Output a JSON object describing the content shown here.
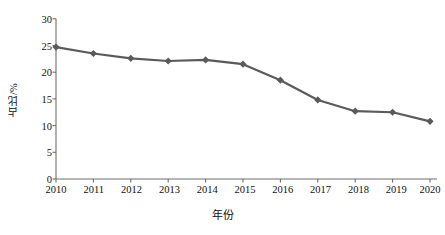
{
  "chart_data": {
    "type": "line",
    "title": "",
    "xlabel": "年份",
    "ylabel": "占比/%",
    "categories": [
      "2010",
      "2011",
      "2012",
      "2013",
      "2014",
      "2015",
      "2016",
      "2017",
      "2018",
      "2019",
      "2020"
    ],
    "values": [
      24.7,
      23.5,
      22.6,
      22.1,
      22.3,
      21.5,
      18.5,
      14.8,
      12.7,
      12.5,
      10.8
    ],
    "series": [
      {
        "name": "占比",
        "values": [
          24.7,
          23.5,
          22.6,
          22.1,
          22.3,
          21.5,
          18.5,
          14.8,
          12.7,
          12.5,
          10.8
        ]
      }
    ],
    "ylim": [
      0,
      30
    ],
    "yticks": [
      "0",
      "5",
      "10",
      "15",
      "20",
      "25",
      "30"
    ],
    "ytick_values": [
      0,
      5,
      10,
      15,
      20,
      25,
      30
    ],
    "grid": false,
    "legend": "none",
    "line_color": "#5a5a5a",
    "marker": "diamond",
    "marker_color": "#5a5a5a",
    "axis_color": "#6e6e6e",
    "background": "#ffffff"
  },
  "axes": {
    "y_title": "占比/%",
    "x_title": "年份"
  }
}
